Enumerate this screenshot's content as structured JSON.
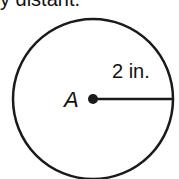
{
  "question": {
    "partial_text": "y distant."
  },
  "diagram": {
    "center_label": "A",
    "radius_label": "2 in.",
    "stroke_color": "#1a1a1a"
  }
}
